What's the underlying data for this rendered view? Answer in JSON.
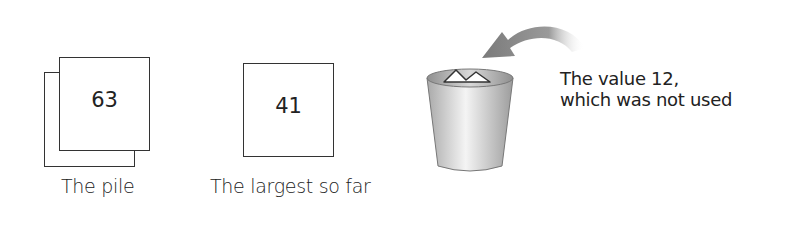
{
  "pile": {
    "value": "63",
    "caption": "The pile"
  },
  "largest": {
    "value": "41",
    "caption": "The largest so far"
  },
  "discarded": {
    "line1": "The value 12,",
    "line2": "which was not used"
  },
  "icons": {
    "bin": "trash-bin-icon",
    "arrow": "curved-arrow-icon"
  },
  "colors": {
    "stroke": "#333333",
    "text": "#222222",
    "arrow": "#8a8a8a",
    "bin_light": "#f2f2f2",
    "bin_dark": "#9a9a9a"
  }
}
